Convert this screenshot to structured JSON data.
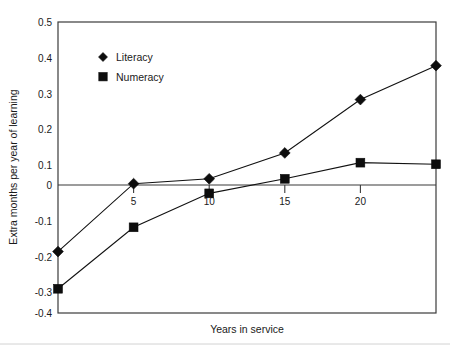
{
  "chart_data": {
    "type": "line",
    "title": "",
    "xlabel": "Years in service",
    "ylabel": "Extra months per year of learning",
    "xlim": [
      0,
      25
    ],
    "ylim": [
      -0.4,
      0.5
    ],
    "grid": false,
    "legend_position": "upper-left-inside",
    "x_ticks": [
      5,
      10,
      15,
      20
    ],
    "x_tick_labels": [
      "5",
      "10",
      "15",
      "20"
    ],
    "y_ticks": [
      -0.4,
      -0.3,
      -0.2,
      -0.1,
      0,
      0.1,
      0.2,
      0.3,
      0.4,
      0.5
    ],
    "y_tick_labels": [
      "-0.4",
      "-0.3",
      "-0.2",
      "-0.1",
      "0",
      "0.1",
      "0.2",
      "0.3",
      "0.4",
      "0.5"
    ],
    "x": [
      0,
      5,
      10,
      15,
      20,
      25
    ],
    "series": [
      {
        "name": "Literacy",
        "marker": "diamond",
        "color": "#0d0d0d",
        "values": [
          -0.21,
          0.0,
          0.015,
          0.095,
          0.26,
          0.365
        ]
      },
      {
        "name": "Numeracy",
        "marker": "square",
        "color": "#0d0d0d",
        "values": [
          -0.325,
          -0.135,
          -0.03,
          0.015,
          0.065,
          0.06
        ]
      }
    ]
  },
  "legend": {
    "items": [
      {
        "label": "Literacy",
        "marker": "diamond"
      },
      {
        "label": "Numeracy",
        "marker": "square"
      }
    ]
  },
  "axes": {
    "x_title": "Years in service",
    "y_title": "Extra months per year of learning"
  },
  "colors": {
    "ink": "#0d0d0d",
    "frame": "#3b3b3b",
    "background": "#ffffff",
    "footer_rule": "#d2d2d2"
  }
}
